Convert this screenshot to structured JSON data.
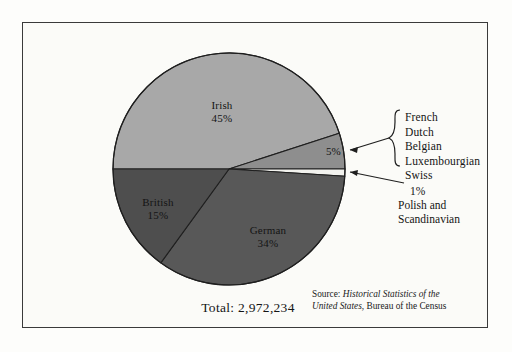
{
  "figure": {
    "total_label": "Total: 2,972,234",
    "source_prefix": "Source: ",
    "source_title_line1": "Historical Statistics of the",
    "source_title_line2": "United States",
    "source_rest": ", Bureau of the Census",
    "background_color": "#fbfbf8",
    "frame_color": "#3a3a3a"
  },
  "callouts": {
    "group_items": [
      "French",
      "Dutch",
      "Belgian",
      "Luxembourgian",
      "Swiss"
    ],
    "group_percent": "5%",
    "minor_percent": "1%",
    "minor_line1": "Polish and",
    "minor_line2": "Scandinavian"
  },
  "chart_data": {
    "type": "pie",
    "title": "",
    "total": 2972234,
    "total_text": "Total: 2,972,234",
    "categories": [
      "Irish",
      "French, Dutch, Belgian, Luxembourgian, Swiss",
      "Polish and Scandinavian",
      "German",
      "British"
    ],
    "values": [
      45,
      5,
      1,
      34,
      15
    ],
    "value_unit": "percent",
    "slices": [
      {
        "name": "Irish",
        "label": "Irish",
        "percent": 45,
        "percent_text": "45%",
        "color": "#a8a8a8",
        "label_inside": true
      },
      {
        "name": "French, Dutch, Belgian, Luxembourgian, Swiss",
        "label": "",
        "percent": 5,
        "percent_text": "5%",
        "color": "#8e8e8e",
        "label_inside": true
      },
      {
        "name": "Polish and Scandinavian",
        "label": "",
        "percent": 1,
        "percent_text": "1%",
        "color": "#f2f2ee",
        "label_inside": false
      },
      {
        "name": "German",
        "label": "German",
        "percent": 34,
        "percent_text": "34%",
        "color": "#585858",
        "label_inside": true
      },
      {
        "name": "British",
        "label": "British",
        "percent": 15,
        "percent_text": "15%",
        "color": "#4e4e4e",
        "label_inside": true
      }
    ],
    "legend": "callout-right",
    "start_angle_deg": 180,
    "direction": "clockwise",
    "source": "Source: Historical Statistics of the United States, Bureau of the Census"
  }
}
